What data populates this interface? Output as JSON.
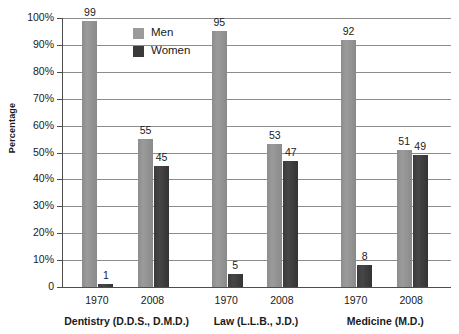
{
  "chart_data": {
    "type": "bar",
    "title": "",
    "xlabel": "",
    "ylabel": "Percentage",
    "ylim": [
      0,
      100
    ],
    "grid": true,
    "legend_position": "top-center-inside",
    "y_ticks": [
      "100%",
      "90%",
      "80%",
      "70%",
      "60%",
      "50%",
      "40%",
      "30%",
      "20%",
      "10%",
      "0"
    ],
    "y_tick_values": [
      100,
      90,
      80,
      70,
      60,
      50,
      40,
      30,
      20,
      10,
      0
    ],
    "categories": [
      "1970",
      "2008",
      "1970",
      "2008",
      "1970",
      "2008"
    ],
    "groups": [
      {
        "name": "Dentistry (D.D.S., D.M.D.)",
        "years": [
          "1970",
          "2008"
        ],
        "men": [
          99,
          55
        ],
        "women": [
          1,
          45
        ]
      },
      {
        "name": "Law (L.L.B., J.D.)",
        "years": [
          "1970",
          "2008"
        ],
        "men": [
          95,
          53
        ],
        "women": [
          5,
          47
        ]
      },
      {
        "name": "Medicine (M.D.)",
        "years": [
          "1970",
          "2008"
        ],
        "men": [
          92,
          51
        ],
        "women": [
          8,
          49
        ]
      }
    ],
    "series": [
      {
        "name": "Men",
        "values": [
          99,
          55,
          95,
          53,
          92,
          51
        ],
        "color": "#9b9b9b"
      },
      {
        "name": "Women",
        "values": [
          1,
          45,
          5,
          47,
          8,
          49
        ],
        "color": "#3a3a3a"
      }
    ],
    "legend": [
      {
        "label": "Men",
        "color": "#9b9b9b"
      },
      {
        "label": "Women",
        "color": "#3a3a3a"
      }
    ]
  },
  "axis": {
    "y_title": "Percentage"
  },
  "colors": {
    "men": "#9b9b9b",
    "women": "#3a3a3a",
    "gridline": "#8c8c8c",
    "axis": "#4d4d4d",
    "text": "#1a1a1a",
    "background": "#ffffff"
  }
}
